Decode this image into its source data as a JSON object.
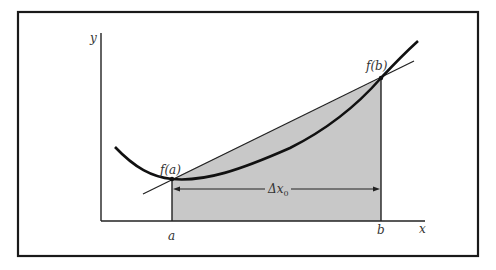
{
  "figure": {
    "axes": {
      "y_label": "y",
      "x_label": "x"
    },
    "points": {
      "a_label": "a",
      "b_label": "b",
      "fa_label": "f(a)",
      "fb_label": "f(b)"
    },
    "interval": {
      "delta_label": "Δx",
      "delta_subscript": "0"
    },
    "colors": {
      "frame": "#1a1a1a",
      "curve": "#111111",
      "fill": "#c8c8c8",
      "axis": "#222222"
    }
  }
}
